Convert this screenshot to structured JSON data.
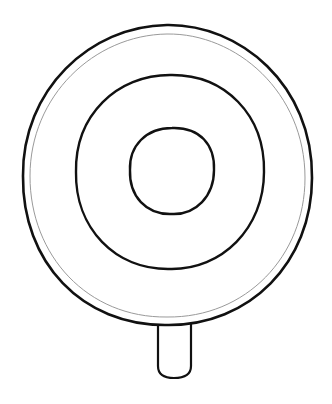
{
  "illustration": {
    "subject": "lollipop",
    "style": "line-art",
    "background_color": "#ffffff",
    "stroke_color": "#111111",
    "inner_guide_color": "#9a9a9a",
    "parts": [
      {
        "name": "outer-ring",
        "shape": "circle"
      },
      {
        "name": "outer-guide-ring",
        "shape": "circle"
      },
      {
        "name": "middle-ring",
        "shape": "circle"
      },
      {
        "name": "inner-ring",
        "shape": "circle"
      },
      {
        "name": "stick",
        "shape": "rounded-rect"
      }
    ]
  }
}
